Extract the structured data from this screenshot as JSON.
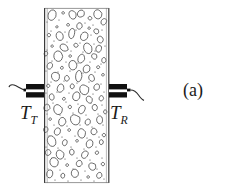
{
  "figure": {
    "caption": "(a)",
    "background_color": "#ffffff",
    "ink_color": "#1a1a1a",
    "width": 227,
    "height": 192
  },
  "labels": {
    "transmitter": {
      "base": "T",
      "subscript": "T"
    },
    "receiver": {
      "base": "T",
      "subscript": "R"
    }
  },
  "specimen": {
    "name": "concrete-wall",
    "left_face_x": 44,
    "right_face_x": 109,
    "top_y": 8,
    "bottom_y": 183,
    "face_line_color": "#3a3a3a",
    "fill_color": "#ffffff",
    "aggregate_outline_color": "#2b2b2b"
  },
  "transducers": {
    "transmitter": {
      "body_x": 26,
      "body_y": 84,
      "body_width": 18,
      "body_height": 14,
      "body_color": "#111111",
      "stripe_color": "#ffffff",
      "cable_color": "#2b2b2b"
    },
    "receiver": {
      "body_x": 109,
      "body_y": 84,
      "body_width": 18,
      "body_height": 14,
      "body_color": "#111111",
      "stripe_color": "#ffffff",
      "cable_color": "#2b2b2b"
    }
  },
  "aggregate_particles": [
    {
      "cx": 52,
      "cy": 16,
      "rx": 4.0,
      "ry": 5.5,
      "rot": 12
    },
    {
      "cx": 63,
      "cy": 13,
      "rx": 1.4,
      "ry": 1.4,
      "rot": 0
    },
    {
      "cx": 72,
      "cy": 15,
      "rx": 3.6,
      "ry": 4.6,
      "rot": -25
    },
    {
      "cx": 81,
      "cy": 13,
      "rx": 3.2,
      "ry": 4.0,
      "rot": 40
    },
    {
      "cx": 90,
      "cy": 18,
      "rx": 1.8,
      "ry": 1.8,
      "rot": 0
    },
    {
      "cx": 98,
      "cy": 14,
      "rx": 3.8,
      "ry": 4.4,
      "rot": -10
    },
    {
      "cx": 104,
      "cy": 22,
      "rx": 2.6,
      "ry": 3.2,
      "rot": 30
    },
    {
      "cx": 57,
      "cy": 27,
      "rx": 1.2,
      "ry": 1.2,
      "rot": 0
    },
    {
      "cx": 68,
      "cy": 25,
      "rx": 1.5,
      "ry": 1.5,
      "rot": 0
    },
    {
      "cx": 79,
      "cy": 26,
      "rx": 2.8,
      "ry": 3.4,
      "rot": 15
    },
    {
      "cx": 89,
      "cy": 28,
      "rx": 1.3,
      "ry": 1.3,
      "rot": 0
    },
    {
      "cx": 96,
      "cy": 31,
      "rx": 2.2,
      "ry": 2.8,
      "rot": -35
    },
    {
      "cx": 49,
      "cy": 35,
      "rx": 1.6,
      "ry": 1.6,
      "rot": 0
    },
    {
      "cx": 60,
      "cy": 36,
      "rx": 3.4,
      "ry": 4.2,
      "rot": -18
    },
    {
      "cx": 72,
      "cy": 34,
      "rx": 3.0,
      "ry": 5.0,
      "rot": 8
    },
    {
      "cx": 84,
      "cy": 37,
      "rx": 3.6,
      "ry": 4.6,
      "rot": 22
    },
    {
      "cx": 100,
      "cy": 40,
      "rx": 3.0,
      "ry": 3.6,
      "rot": -12
    },
    {
      "cx": 52,
      "cy": 46,
      "rx": 1.3,
      "ry": 1.3,
      "rot": 0
    },
    {
      "cx": 64,
      "cy": 47,
      "rx": 4.2,
      "ry": 3.4,
      "rot": 35
    },
    {
      "cx": 76,
      "cy": 45,
      "rx": 2.0,
      "ry": 2.0,
      "rot": 0
    },
    {
      "cx": 88,
      "cy": 48,
      "rx": 3.8,
      "ry": 5.2,
      "rot": -20
    },
    {
      "cx": 99,
      "cy": 49,
      "rx": 2.8,
      "ry": 3.4,
      "rot": 14
    },
    {
      "cx": 46,
      "cy": 54,
      "rx": 1.9,
      "ry": 2.4,
      "rot": 0
    },
    {
      "cx": 58,
      "cy": 57,
      "rx": 4.4,
      "ry": 5.6,
      "rot": -8
    },
    {
      "cx": 70,
      "cy": 56,
      "rx": 1.4,
      "ry": 1.4,
      "rot": 0
    },
    {
      "cx": 81,
      "cy": 58,
      "rx": 3.2,
      "ry": 4.8,
      "rot": 18
    },
    {
      "cx": 94,
      "cy": 56,
      "rx": 2.4,
      "ry": 3.0,
      "rot": -30
    },
    {
      "cx": 104,
      "cy": 60,
      "rx": 2.0,
      "ry": 2.6,
      "rot": 10
    },
    {
      "cx": 50,
      "cy": 66,
      "rx": 2.6,
      "ry": 3.2,
      "rot": 25
    },
    {
      "cx": 62,
      "cy": 68,
      "rx": 1.5,
      "ry": 1.5,
      "rot": 0
    },
    {
      "cx": 73,
      "cy": 66,
      "rx": 4.0,
      "ry": 5.0,
      "rot": -14
    },
    {
      "cx": 86,
      "cy": 69,
      "rx": 3.4,
      "ry": 4.2,
      "rot": 30
    },
    {
      "cx": 98,
      "cy": 67,
      "rx": 1.6,
      "ry": 1.6,
      "rot": 0
    },
    {
      "cx": 55,
      "cy": 76,
      "rx": 3.8,
      "ry": 4.8,
      "rot": -22
    },
    {
      "cx": 67,
      "cy": 78,
      "rx": 2.2,
      "ry": 2.8,
      "rot": 12
    },
    {
      "cx": 79,
      "cy": 76,
      "rx": 3.0,
      "ry": 5.4,
      "rot": 6
    },
    {
      "cx": 92,
      "cy": 78,
      "rx": 2.8,
      "ry": 3.4,
      "rot": -28
    },
    {
      "cx": 103,
      "cy": 75,
      "rx": 1.4,
      "ry": 1.4,
      "rot": 0
    },
    {
      "cx": 48,
      "cy": 86,
      "rx": 1.8,
      "ry": 1.8,
      "rot": 0
    },
    {
      "cx": 60,
      "cy": 88,
      "rx": 3.4,
      "ry": 4.4,
      "rot": 20
    },
    {
      "cx": 72,
      "cy": 86,
      "rx": 2.0,
      "ry": 2.6,
      "rot": 0
    },
    {
      "cx": 84,
      "cy": 89,
      "rx": 4.2,
      "ry": 5.2,
      "rot": -16
    },
    {
      "cx": 97,
      "cy": 87,
      "rx": 2.6,
      "ry": 3.2,
      "rot": 34
    },
    {
      "cx": 52,
      "cy": 97,
      "rx": 2.4,
      "ry": 3.0,
      "rot": -10
    },
    {
      "cx": 64,
      "cy": 99,
      "rx": 1.5,
      "ry": 1.5,
      "rot": 0
    },
    {
      "cx": 76,
      "cy": 97,
      "rx": 3.6,
      "ry": 4.8,
      "rot": 16
    },
    {
      "cx": 89,
      "cy": 100,
      "rx": 3.0,
      "ry": 3.8,
      "rot": -24
    },
    {
      "cx": 101,
      "cy": 98,
      "rx": 2.2,
      "ry": 2.8,
      "rot": 8
    },
    {
      "cx": 47,
      "cy": 107,
      "rx": 2.8,
      "ry": 3.6,
      "rot": 28
    },
    {
      "cx": 58,
      "cy": 109,
      "rx": 4.0,
      "ry": 5.0,
      "rot": -12
    },
    {
      "cx": 70,
      "cy": 107,
      "rx": 1.6,
      "ry": 1.6,
      "rot": 0
    },
    {
      "cx": 82,
      "cy": 110,
      "rx": 3.2,
      "ry": 4.2,
      "rot": 22
    },
    {
      "cx": 95,
      "cy": 108,
      "rx": 2.6,
      "ry": 3.2,
      "rot": -18
    },
    {
      "cx": 105,
      "cy": 112,
      "rx": 1.8,
      "ry": 2.2,
      "rot": 0
    },
    {
      "cx": 50,
      "cy": 119,
      "rx": 1.4,
      "ry": 1.4,
      "rot": 0
    },
    {
      "cx": 62,
      "cy": 121,
      "rx": 3.4,
      "ry": 4.6,
      "rot": 14
    },
    {
      "cx": 75,
      "cy": 119,
      "rx": 4.4,
      "ry": 5.4,
      "rot": -20
    },
    {
      "cx": 88,
      "cy": 122,
      "rx": 2.4,
      "ry": 3.0,
      "rot": 32
    },
    {
      "cx": 100,
      "cy": 120,
      "rx": 3.0,
      "ry": 3.8,
      "rot": -6
    },
    {
      "cx": 46,
      "cy": 130,
      "rx": 2.2,
      "ry": 2.8,
      "rot": 0
    },
    {
      "cx": 57,
      "cy": 132,
      "rx": 3.0,
      "ry": 4.0,
      "rot": 24
    },
    {
      "cx": 69,
      "cy": 130,
      "rx": 1.5,
      "ry": 1.5,
      "rot": 0
    },
    {
      "cx": 81,
      "cy": 133,
      "rx": 3.8,
      "ry": 5.0,
      "rot": -14
    },
    {
      "cx": 94,
      "cy": 131,
      "rx": 2.8,
      "ry": 3.4,
      "rot": 18
    },
    {
      "cx": 104,
      "cy": 135,
      "rx": 1.6,
      "ry": 1.6,
      "rot": 0
    },
    {
      "cx": 52,
      "cy": 141,
      "rx": 4.0,
      "ry": 5.2,
      "rot": -22
    },
    {
      "cx": 65,
      "cy": 143,
      "rx": 2.4,
      "ry": 3.0,
      "rot": 10
    },
    {
      "cx": 77,
      "cy": 141,
      "rx": 1.4,
      "ry": 1.4,
      "rot": 0
    },
    {
      "cx": 89,
      "cy": 144,
      "rx": 3.4,
      "ry": 4.4,
      "rot": 26
    },
    {
      "cx": 101,
      "cy": 142,
      "rx": 2.0,
      "ry": 2.6,
      "rot": 0
    },
    {
      "cx": 48,
      "cy": 152,
      "rx": 2.6,
      "ry": 3.2,
      "rot": 16
    },
    {
      "cx": 60,
      "cy": 154,
      "rx": 3.6,
      "ry": 4.6,
      "rot": -10
    },
    {
      "cx": 72,
      "cy": 152,
      "rx": 2.2,
      "ry": 2.8,
      "rot": 0
    },
    {
      "cx": 85,
      "cy": 155,
      "rx": 3.0,
      "ry": 3.8,
      "rot": 30
    },
    {
      "cx": 97,
      "cy": 153,
      "rx": 1.8,
      "ry": 1.8,
      "rot": 0
    },
    {
      "cx": 54,
      "cy": 163,
      "rx": 4.2,
      "ry": 5.0,
      "rot": -18
    },
    {
      "cx": 67,
      "cy": 165,
      "rx": 1.5,
      "ry": 1.5,
      "rot": 0
    },
    {
      "cx": 79,
      "cy": 163,
      "rx": 2.8,
      "ry": 3.4,
      "rot": 20
    },
    {
      "cx": 92,
      "cy": 166,
      "rx": 3.2,
      "ry": 4.0,
      "rot": -26
    },
    {
      "cx": 103,
      "cy": 164,
      "rx": 1.6,
      "ry": 1.6,
      "rot": 0
    },
    {
      "cx": 50,
      "cy": 174,
      "rx": 3.0,
      "ry": 3.8,
      "rot": 12
    },
    {
      "cx": 63,
      "cy": 176,
      "rx": 2.0,
      "ry": 2.4,
      "rot": 0
    },
    {
      "cx": 75,
      "cy": 174,
      "rx": 3.6,
      "ry": 4.4,
      "rot": -16
    },
    {
      "cx": 88,
      "cy": 177,
      "rx": 1.4,
      "ry": 1.4,
      "rot": 0
    },
    {
      "cx": 99,
      "cy": 175,
      "rx": 2.6,
      "ry": 3.2,
      "rot": 22
    }
  ],
  "speckles": [
    {
      "cx": 47,
      "cy": 22
    },
    {
      "cx": 59,
      "cy": 20
    },
    {
      "cx": 85,
      "cy": 23
    },
    {
      "cx": 93,
      "cy": 25
    },
    {
      "cx": 102,
      "cy": 30
    },
    {
      "cx": 51,
      "cy": 31
    },
    {
      "cx": 65,
      "cy": 32
    },
    {
      "cx": 76,
      "cy": 30
    },
    {
      "cx": 91,
      "cy": 35
    },
    {
      "cx": 54,
      "cy": 41
    },
    {
      "cx": 67,
      "cy": 42
    },
    {
      "cx": 80,
      "cy": 43
    },
    {
      "cx": 94,
      "cy": 44
    },
    {
      "cx": 105,
      "cy": 46
    },
    {
      "cx": 47,
      "cy": 50
    },
    {
      "cx": 71,
      "cy": 51
    },
    {
      "cx": 83,
      "cy": 52
    },
    {
      "cx": 95,
      "cy": 51
    },
    {
      "cx": 52,
      "cy": 61
    },
    {
      "cx": 66,
      "cy": 62
    },
    {
      "cx": 78,
      "cy": 63
    },
    {
      "cx": 90,
      "cy": 62
    },
    {
      "cx": 101,
      "cy": 64
    },
    {
      "cx": 46,
      "cy": 71
    },
    {
      "cx": 58,
      "cy": 72
    },
    {
      "cx": 70,
      "cy": 71
    },
    {
      "cx": 83,
      "cy": 73
    },
    {
      "cx": 95,
      "cy": 72
    },
    {
      "cx": 51,
      "cy": 82
    },
    {
      "cx": 64,
      "cy": 81
    },
    {
      "cx": 77,
      "cy": 83
    },
    {
      "cx": 89,
      "cy": 82
    },
    {
      "cx": 101,
      "cy": 84
    },
    {
      "cx": 46,
      "cy": 93
    },
    {
      "cx": 57,
      "cy": 92
    },
    {
      "cx": 69,
      "cy": 93
    },
    {
      "cx": 81,
      "cy": 92
    },
    {
      "cx": 93,
      "cy": 94
    },
    {
      "cx": 104,
      "cy": 92
    },
    {
      "cx": 53,
      "cy": 103
    },
    {
      "cx": 66,
      "cy": 102
    },
    {
      "cx": 78,
      "cy": 104
    },
    {
      "cx": 91,
      "cy": 103
    },
    {
      "cx": 102,
      "cy": 105
    },
    {
      "cx": 47,
      "cy": 114
    },
    {
      "cx": 60,
      "cy": 115
    },
    {
      "cx": 73,
      "cy": 113
    },
    {
      "cx": 86,
      "cy": 115
    },
    {
      "cx": 98,
      "cy": 114
    },
    {
      "cx": 54,
      "cy": 125
    },
    {
      "cx": 67,
      "cy": 126
    },
    {
      "cx": 80,
      "cy": 125
    },
    {
      "cx": 92,
      "cy": 127
    },
    {
      "cx": 103,
      "cy": 125
    },
    {
      "cx": 49,
      "cy": 136
    },
    {
      "cx": 62,
      "cy": 137
    },
    {
      "cx": 75,
      "cy": 136
    },
    {
      "cx": 87,
      "cy": 138
    },
    {
      "cx": 99,
      "cy": 137
    },
    {
      "cx": 46,
      "cy": 147
    },
    {
      "cx": 58,
      "cy": 148
    },
    {
      "cx": 71,
      "cy": 147
    },
    {
      "cx": 84,
      "cy": 149
    },
    {
      "cx": 96,
      "cy": 147
    },
    {
      "cx": 52,
      "cy": 158
    },
    {
      "cx": 65,
      "cy": 159
    },
    {
      "cx": 77,
      "cy": 158
    },
    {
      "cx": 90,
      "cy": 160
    },
    {
      "cx": 102,
      "cy": 158
    },
    {
      "cx": 48,
      "cy": 169
    },
    {
      "cx": 60,
      "cy": 170
    },
    {
      "cx": 73,
      "cy": 169
    },
    {
      "cx": 85,
      "cy": 171
    },
    {
      "cx": 97,
      "cy": 169
    },
    {
      "cx": 55,
      "cy": 180
    },
    {
      "cx": 68,
      "cy": 181
    },
    {
      "cx": 81,
      "cy": 180
    },
    {
      "cx": 94,
      "cy": 181
    },
    {
      "cx": 104,
      "cy": 179
    }
  ]
}
